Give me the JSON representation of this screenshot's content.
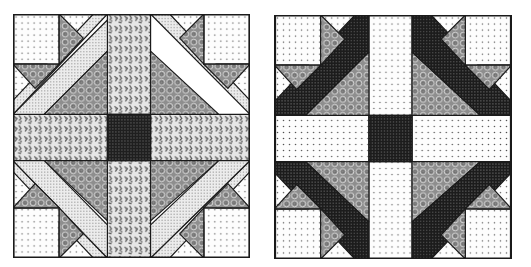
{
  "figure": {
    "blocks": [
      {
        "id": "left",
        "fabrics": {
          "corner_square": "dotted-light",
          "small_triangle_light": "dotted-light",
          "small_triangle_dark": "swirl-medium",
          "diagonal_strip": "pindot-light",
          "large_triangle": "swirl-medium",
          "sashing": "floral-medium",
          "center": "grid-dark"
        }
      },
      {
        "id": "right",
        "fabrics": {
          "corner_square": "dotted-light",
          "small_triangle_light": "dotted-light",
          "small_triangle_dark": "swirl-medium",
          "diagonal_strip": "check-dark",
          "large_triangle": "swirl-medium",
          "sashing": "dotted-light",
          "center": "check-dark"
        }
      }
    ]
  },
  "colors": {
    "outline": "#1a1a1a",
    "background": "#ffffff",
    "dark": "#2a2a2a",
    "medium": "#8a8a8a",
    "light": "#f4f4f4"
  }
}
